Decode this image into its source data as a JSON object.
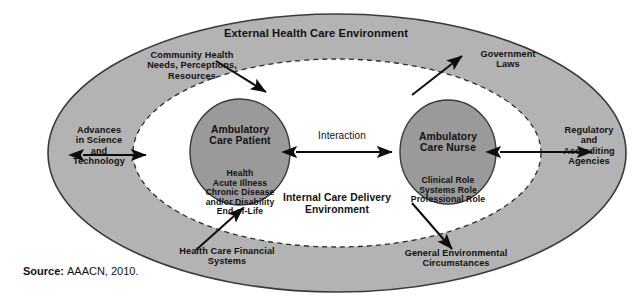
{
  "figure": {
    "type": "conceptual-model-diagram",
    "external_ring_title": "External Health Care Environment",
    "internal_region_title": "Internal Care Delivery Environment",
    "interaction_label": "Interaction",
    "source_prefix": "Source:",
    "source_value": "AAACN, 2010."
  },
  "colors": {
    "outer_ring_fill": "#b3b3b3",
    "inner_region_fill": "#ffffff",
    "core_ellipse_fill": "#9a9a9a",
    "outline": "#3a3a3a",
    "text": "#111111",
    "arrow": "#0d0d0d"
  },
  "core_nodes": [
    {
      "id": "ambulatory-care-patient",
      "title": "Ambulatory\nCare Patient",
      "attributes": "Health\nAcute Illness\nChronic Disease\nand/or Disability\nEnd-of-Life"
    },
    {
      "id": "ambulatory-care-nurse",
      "title": "Ambulatory\nCare Nurse",
      "attributes": "Clinical Role\nSystems Role\nProfessional Role"
    }
  ],
  "external_factors": [
    {
      "id": "community-health",
      "label": "Community Health\nNeeds, Perceptions,\nResources",
      "position": "top-left"
    },
    {
      "id": "government-laws",
      "label": "Government\nLaws",
      "position": "top-right"
    },
    {
      "id": "advances-science-technology",
      "label": "Advances\nin Science\nand\nTechnology",
      "position": "left"
    },
    {
      "id": "regulatory-accrediting-agencies",
      "label": "Regulatory\nand\nAccrediting\nAgencies",
      "position": "right"
    },
    {
      "id": "health-care-financial-systems",
      "label": "Health Care Financial\nSystems",
      "position": "bottom-left"
    },
    {
      "id": "general-environmental-circumstances",
      "label": "General Environmental\nCircumstances",
      "position": "bottom-right"
    }
  ]
}
